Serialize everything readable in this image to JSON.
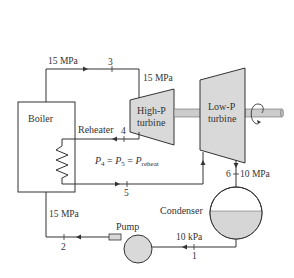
{
  "diagram": {
    "components": {
      "boiler": {
        "label": "Boiler"
      },
      "reheater": {
        "label": "Reheater"
      },
      "hp_turbine": {
        "label_line1": "High-P",
        "label_line2": "turbine"
      },
      "lp_turbine": {
        "label_line1": "Low-P",
        "label_line2": "turbine"
      },
      "condenser": {
        "label": "Condenser"
      },
      "pump": {
        "label": "Pump"
      }
    },
    "states": {
      "s1": "1",
      "s2": "2",
      "s3": "3",
      "s4": "4",
      "s5": "5",
      "s6": "6"
    },
    "pressures": {
      "boiler_exit": "15 MPa",
      "hp_turbine_inlet": "15 MPa",
      "pump_exit": "15 MPa",
      "lp_turbine_exit": "10 MPa",
      "condenser_exit": "10 kPa"
    },
    "equation": {
      "p4": "P",
      "p4_sub": "4",
      "eq1": " = ",
      "p5": "P",
      "p5_sub": "5",
      "eq2": " = ",
      "preheat": "P",
      "preheat_sub": "reheat"
    },
    "colors": {
      "line": "#333333",
      "component_fill": "#d9d9d9",
      "shaft": "#cccccc",
      "water": "#d6d6d6"
    }
  }
}
